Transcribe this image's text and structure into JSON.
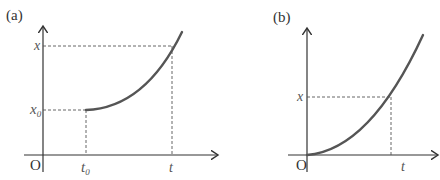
{
  "panels": [
    {
      "id": "a",
      "label": "(a)",
      "origin_label": "O",
      "y_tick_labels": [
        {
          "main": "x",
          "sub": "0"
        },
        {
          "main": "x",
          "sub": ""
        }
      ],
      "x_tick_labels": [
        {
          "main": "t",
          "sub": "0"
        },
        {
          "main": "t",
          "sub": ""
        }
      ],
      "description": "position-time curve starting at (t0, x0), increasing and concave up"
    },
    {
      "id": "b",
      "label": "(b)",
      "origin_label": "O",
      "y_tick_labels": [
        {
          "main": "x",
          "sub": ""
        }
      ],
      "x_tick_labels": [
        {
          "main": "t",
          "sub": ""
        }
      ],
      "description": "position-time curve starting at origin, increasing and concave up"
    }
  ]
}
